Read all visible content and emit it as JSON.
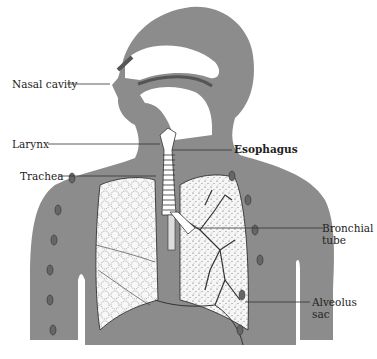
{
  "diagram": {
    "labels": [
      {
        "id": "nasal-cavity",
        "text": "Nasal cavity"
      },
      {
        "id": "larynx",
        "text": "Larynx"
      },
      {
        "id": "esophagus",
        "text": "Esophagus"
      },
      {
        "id": "trachea",
        "text": "Trachea"
      },
      {
        "id": "bronchial-tube",
        "line1": "Bronchial",
        "line2": "tube"
      },
      {
        "id": "alveolus-sac",
        "line1": "Alveolus",
        "line2": "sac"
      }
    ],
    "colors": {
      "body_silhouette": "#8c8c8c",
      "lung_fill": "#f4f4f4",
      "outline": "#333333",
      "background": "#ffffff"
    }
  }
}
